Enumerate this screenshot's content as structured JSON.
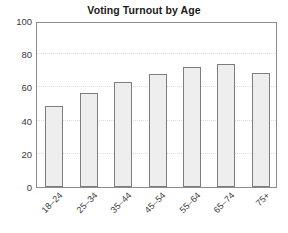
{
  "chart_data": {
    "type": "bar",
    "title": "Voting Turnout by Age",
    "xlabel": "",
    "ylabel": "",
    "categories": [
      "18–24",
      "25–34",
      "35–44",
      "45–54",
      "55–64",
      "65–74",
      "75+"
    ],
    "values": [
      49,
      56.5,
      63,
      68,
      72,
      74,
      68.5
    ],
    "ylim": [
      0,
      100
    ],
    "yticks": [
      0,
      20,
      40,
      60,
      80,
      100
    ],
    "ytick_labels": [
      "0",
      "20",
      "40",
      "60",
      "80",
      "100"
    ],
    "grid": true,
    "grid_axis": "y",
    "legend": false,
    "legend_position": "none",
    "series": [
      {
        "name": "Turnout",
        "values": [
          49,
          56.5,
          63,
          68,
          72,
          74,
          68.5
        ]
      }
    ],
    "colors": {
      "bar_fill": "#eeeeee",
      "bar_edge": "#7d7d7d",
      "axis": "#8c8c8c",
      "gridline": "#dcdcdc",
      "text": "#3a3a3a",
      "title": "#1a1a1a",
      "background": "#ffffff"
    }
  }
}
